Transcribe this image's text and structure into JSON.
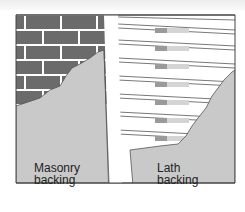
{
  "diagram": {
    "panels": [
      {
        "id": "masonry",
        "label_line1": "Masonry",
        "label_line2": "backing"
      },
      {
        "id": "lath",
        "label_line1": "Lath",
        "label_line2": "backing"
      }
    ],
    "colors": {
      "brick": "#6b6b6b",
      "mortar": "#ffffff",
      "plaster": "#c9c9c9",
      "lath_slat": "#ffffff",
      "lath_line": "#555555",
      "stud_dark": "#9a9a9a",
      "stud_light": "#d4d4d4",
      "frame": "#444444"
    }
  }
}
